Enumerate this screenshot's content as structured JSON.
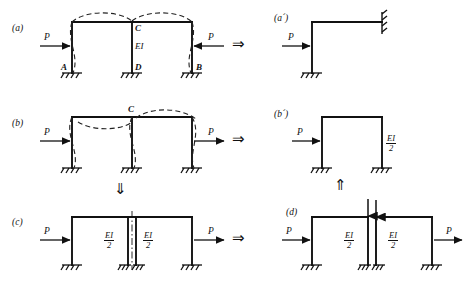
{
  "figure": {
    "type": "structural-mechanics-diagram",
    "implication_symbol": "⇒",
    "down_symbol": "⇓",
    "up_symbol": "⇑"
  },
  "panels": {
    "a": {
      "tag": "(a)",
      "description": "Two-bay symmetric frame under symmetric loads P pointing inward",
      "loads": [
        {
          "label": "P",
          "direction": "right"
        },
        {
          "label": "P",
          "direction": "left"
        }
      ],
      "nodes": [
        {
          "label": "A",
          "position": "left-column-base"
        },
        {
          "label": "B",
          "position": "right-column-base"
        },
        {
          "label": "C",
          "position": "middle-column-top"
        },
        {
          "label": "D",
          "position": "middle-column-base"
        }
      ],
      "stiffness": "EI",
      "supports": 3,
      "deflection": "symmetric dashed deflected shape"
    },
    "a_prime": {
      "tag": "(a´)",
      "description": "Equivalent half frame with guided (sliding) support at the symmetry axis",
      "loads": [
        {
          "label": "P",
          "direction": "right"
        }
      ],
      "supports": 1,
      "right_support": "guided-sliding-support"
    },
    "b": {
      "tag": "(b)",
      "description": "Two-bay frame under antisymmetric loads P both pointing right",
      "loads": [
        {
          "label": "P",
          "direction": "right"
        },
        {
          "label": "P",
          "direction": "right"
        }
      ],
      "nodes": [
        {
          "label": "C",
          "position": "middle-column-top"
        }
      ],
      "supports": 3,
      "deflection": "antisymmetric dashed deflected shape"
    },
    "b_prime": {
      "tag": "(b´)",
      "description": "Equivalent single-bay portal frame with halved middle column stiffness",
      "loads": [
        {
          "label": "P",
          "direction": "right"
        }
      ],
      "stiffness_num": "EI",
      "stiffness_den": "2",
      "supports": 2
    },
    "c": {
      "tag": "(c)",
      "description": "Middle column split into two columns of stiffness EI/2 along the axis of symmetry",
      "loads": [
        {
          "label": "P",
          "direction": "right"
        },
        {
          "label": "P",
          "direction": "right"
        }
      ],
      "columns": [
        {
          "stiffness_num": "EI",
          "stiffness_den": "2"
        },
        {
          "stiffness_num": "EI",
          "stiffness_den": "2"
        }
      ],
      "centerline": "dash-dot axis of symmetry",
      "supports": 4
    },
    "d": {
      "tag": "(d)",
      "description": "Two separated frames with equal and opposite vertical shear at the cut",
      "loads": [
        {
          "label": "P",
          "direction": "right"
        },
        {
          "label": "P",
          "direction": "right"
        }
      ],
      "columns": [
        {
          "stiffness_num": "EI",
          "stiffness_den": "2"
        },
        {
          "stiffness_num": "EI",
          "stiffness_den": "2"
        }
      ],
      "internal_forces": "equal and opposite vertical shear arrows at the cut",
      "supports": 4
    }
  },
  "colors": {
    "ink": "#111111",
    "background": "#ffffff",
    "dashed": "#222222"
  }
}
